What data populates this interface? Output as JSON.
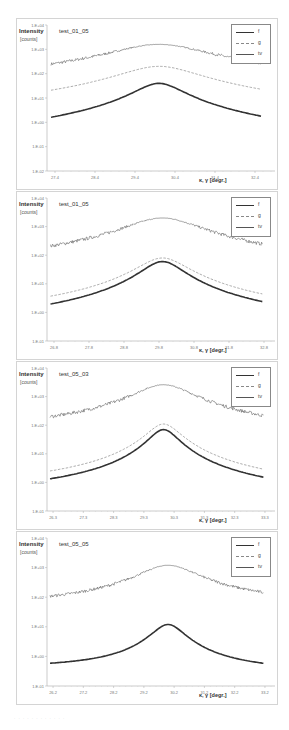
{
  "legend": {
    "items": [
      {
        "label": "f",
        "style": "thick"
      },
      {
        "label": "g",
        "style": "dashed"
      },
      {
        "label": "tv",
        "style": "thin"
      }
    ]
  },
  "axis": {
    "ylabel": "Intensity",
    "yunit": "[counts]",
    "xlabel": "κ, γ [degr.]"
  },
  "chart_data": [
    {
      "type": "line",
      "title": "test_01_05",
      "xlabel": "κ, γ [degr.]",
      "ylabel": "Intensity [counts]",
      "yscale": "log",
      "ylim": [
        0.01,
        10000
      ],
      "yticks": [
        "1.E-02",
        "1.E-01",
        "1.E+00",
        "1.E+01",
        "1.E+02",
        "1.E+03",
        "1.E+04"
      ],
      "xlim": [
        27.2,
        32.8
      ],
      "xticks": [
        "27.4",
        "28.4",
        "29.4",
        "30.4",
        "31.4",
        "32.4"
      ],
      "peak_center": 30.0,
      "series": [
        {
          "name": "f",
          "peak": 40,
          "tail_left": 0.03,
          "tail_right": 0.025,
          "width": 0.55,
          "noise": 0
        },
        {
          "name": "g",
          "peak": 200,
          "tail_left": 1.0,
          "tail_right": 0.9,
          "width": 0.9,
          "noise": 0
        },
        {
          "name": "tv",
          "peak": 1600,
          "tail_left": 25,
          "tail_right": 30,
          "width": 1.1,
          "noise": 0.12
        }
      ],
      "legend_position": "top-right"
    },
    {
      "type": "line",
      "title": "test_01_05",
      "xlabel": "κ, γ [degr.]",
      "ylabel": "Intensity [counts]",
      "yscale": "log",
      "ylim": [
        0.1,
        10000
      ],
      "yticks": [
        "1.E-01",
        "1.E+00",
        "1.E+01",
        "1.E+02",
        "1.E+03",
        "1.E+04"
      ],
      "xlim": [
        26.6,
        33.0
      ],
      "xticks": [
        "26.8",
        "27.8",
        "28.8",
        "29.8",
        "30.8",
        "31.8",
        "32.8"
      ],
      "peak_center": 29.9,
      "series": [
        {
          "name": "f",
          "peak": 60,
          "tail_left": 0.25,
          "tail_right": 0.25,
          "width": 0.55,
          "noise": 0
        },
        {
          "name": "g",
          "peak": 80,
          "tail_left": 0.55,
          "tail_right": 0.5,
          "width": 0.65,
          "noise": 0
        },
        {
          "name": "tv",
          "peak": 2000,
          "tail_left": 35,
          "tail_right": 30,
          "width": 1.0,
          "noise": 0.12
        }
      ],
      "legend_position": "top-right"
    },
    {
      "type": "line",
      "title": "test_05_03",
      "xlabel": "κ, γ [degr.]",
      "ylabel": "Intensity [counts]",
      "yscale": "log",
      "ylim": [
        0.1,
        10000
      ],
      "yticks": [
        "1.E-01",
        "1.E+00",
        "1.E+01",
        "1.E+02",
        "1.E+03",
        "1.E+04"
      ],
      "xlim": [
        26.1,
        33.5
      ],
      "xticks": [
        "26.3",
        "27.3",
        "28.3",
        "29.3",
        "30.3",
        "31.3",
        "32.3",
        "33.3"
      ],
      "peak_center": 29.95,
      "series": [
        {
          "name": "f",
          "peak": 70,
          "tail_left": 0.35,
          "tail_right": 0.25,
          "width": 0.45,
          "noise": 0
        },
        {
          "name": "g",
          "peak": 110,
          "tail_left": 0.6,
          "tail_right": 0.45,
          "width": 0.5,
          "noise": 0
        },
        {
          "name": "tv",
          "peak": 2600,
          "tail_left": 60,
          "tail_right": 40,
          "width": 0.9,
          "noise": 0.12
        }
      ],
      "legend_position": "top-right"
    },
    {
      "type": "line",
      "title": "test_05_05",
      "xlabel": "κ, γ [degr.]",
      "ylabel": "Intensity [counts]",
      "yscale": "log",
      "ylim": [
        0.1,
        10000
      ],
      "yticks": [
        "1.E-01",
        "1.E+00",
        "1.E+01",
        "1.E+02",
        "1.E+03",
        "1.E+04"
      ],
      "xlim": [
        26.0,
        33.4
      ],
      "xticks": [
        "26.2",
        "27.2",
        "28.2",
        "29.2",
        "30.2",
        "31.2",
        "32.2",
        "33.2"
      ],
      "peak_center": 30.0,
      "series": [
        {
          "name": "f",
          "peak": 12,
          "tail_left": 0.4,
          "tail_right": 0.3,
          "width": 0.5,
          "noise": 0
        },
        {
          "name": "g",
          "peak": 12,
          "tail_left": 0.4,
          "tail_right": 0.3,
          "width": 0.5,
          "noise": 0
        },
        {
          "name": "tv",
          "peak": 1200,
          "tail_left": 50,
          "tail_right": 60,
          "width": 0.9,
          "noise": 0.1
        }
      ],
      "legend_position": "top-right"
    }
  ],
  "caption": "· · · ·   ·  ·  · ·   · ·  ·   ·"
}
